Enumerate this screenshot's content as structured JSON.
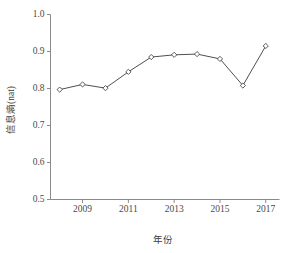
{
  "chart_data": {
    "type": "line",
    "title": "",
    "xlabel": "年份",
    "ylabel": "信息熵(nat)",
    "x": [
      2008,
      2009,
      2010,
      2011,
      2012,
      2013,
      2014,
      2015,
      2016,
      2017
    ],
    "values": [
      0.797,
      0.811,
      0.801,
      0.845,
      0.885,
      0.891,
      0.893,
      0.88,
      0.808,
      0.915
    ],
    "series": [
      {
        "name": "信息熵",
        "values": [
          0.797,
          0.811,
          0.801,
          0.845,
          0.885,
          0.891,
          0.893,
          0.88,
          0.808,
          0.915
        ]
      }
    ],
    "xlim": [
      2007.6,
      2017.6
    ],
    "ylim": [
      0.5,
      1.0
    ],
    "xticks": [
      2009,
      2011,
      2013,
      2015,
      2017
    ],
    "xtick_labels": [
      "2009",
      "2011",
      "2013",
      "2015",
      "2017"
    ],
    "yticks": [
      0.5,
      0.6,
      0.7,
      0.8,
      0.9,
      1.0
    ],
    "ytick_labels": [
      "0.5",
      "0.6",
      "0.7",
      "0.8",
      "0.9",
      "1.0"
    ],
    "grid": false,
    "legend": false,
    "legend_position": "none",
    "marker": "diamond",
    "line_color": "#4f4f4f",
    "marker_face_color": "#ffffff",
    "marker_edge_color": "#4a4a4a",
    "axis_color": "#8a8a8a",
    "background_color": "#ffffff"
  },
  "axis_titles": {
    "x": "年份",
    "y": "信息熵(nat)"
  }
}
